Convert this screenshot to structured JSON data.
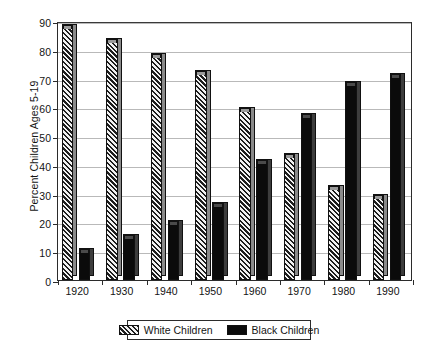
{
  "chart_data": {
    "type": "bar",
    "title": "",
    "xlabel": "",
    "ylabel": "Percent Children Ages 5-19",
    "categories": [
      "1920",
      "1930",
      "1940",
      "1950",
      "1960",
      "1970",
      "1980",
      "1990"
    ],
    "series": [
      {
        "name": "White Children",
        "values": [
          89,
          84,
          79,
          73,
          60,
          44,
          33,
          30
        ]
      },
      {
        "name": "Black Children",
        "values": [
          11,
          16,
          21,
          27,
          42,
          58,
          69,
          72
        ]
      }
    ],
    "ylim": [
      0,
      90
    ],
    "yticks": [
      0,
      10,
      20,
      30,
      40,
      50,
      60,
      70,
      80,
      90
    ],
    "ytick_labels": [
      "0",
      "10",
      "20",
      "30",
      "40",
      "50",
      "60",
      "70",
      "80",
      "90"
    ],
    "grid": true,
    "legend_position": "bottom-center"
  },
  "legend": {
    "entries": [
      {
        "label": "White Children",
        "swatch": "hatched",
        "color": "#d9d9d9"
      },
      {
        "label": "Black Children",
        "swatch": "solid",
        "color": "#0b0b0b"
      }
    ]
  },
  "colors": {
    "white_series": "#d9d9d9",
    "black_series": "#0b0b0b",
    "axis": "#2b2b2b",
    "grid": "#b9b9b9",
    "background": "#ffffff"
  }
}
